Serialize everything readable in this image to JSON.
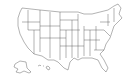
{
  "map": {
    "type": "us-states-outline",
    "background": "#ffffff",
    "stroke_color": "#555555",
    "fill_color": "#ffffff",
    "insets": [
      "alaska",
      "hawaii"
    ]
  }
}
